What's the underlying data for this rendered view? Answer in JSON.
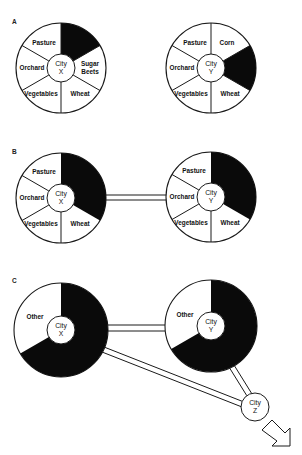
{
  "figure": {
    "panels": [
      {
        "id": "A",
        "label": "A",
        "cities": [
          {
            "name": "City X",
            "line1": "City",
            "line2": "X",
            "sectors": [
              {
                "label": "",
                "filled": true
              },
              {
                "label": "Sugar",
                "label2": "Beets",
                "filled": false
              },
              {
                "label": "Wheat",
                "filled": false
              },
              {
                "label": "Vegetables",
                "filled": false
              },
              {
                "label": "Orchard",
                "filled": false
              },
              {
                "label": "Pasture",
                "filled": false
              }
            ]
          },
          {
            "name": "City Y",
            "line1": "City",
            "line2": "Y",
            "sectors": [
              {
                "label": "Corn",
                "filled": false
              },
              {
                "label": "",
                "filled": true
              },
              {
                "label": "Wheat",
                "filled": false
              },
              {
                "label": "Vegetables",
                "filled": false
              },
              {
                "label": "Orchard",
                "filled": false
              },
              {
                "label": "Pasture",
                "filled": false
              }
            ]
          }
        ]
      },
      {
        "id": "B",
        "label": "B",
        "connection": "double road between City X and City Y",
        "cities": [
          {
            "name": "City X",
            "line1": "City",
            "line2": "X",
            "sectors": [
              {
                "label": "",
                "filled": true,
                "span": 2
              },
              {
                "label": "Wheat",
                "filled": false
              },
              {
                "label": "Vegetables",
                "filled": false
              },
              {
                "label": "Orchard",
                "filled": false
              },
              {
                "label": "Pasture",
                "filled": false
              }
            ]
          },
          {
            "name": "City Y",
            "line1": "City",
            "line2": "Y",
            "sectors": [
              {
                "label": "",
                "filled": true,
                "span": 2
              },
              {
                "label": "Wheat",
                "filled": false
              },
              {
                "label": "Vegetables",
                "filled": false
              },
              {
                "label": "Orchard",
                "filled": false
              },
              {
                "label": "Pasture",
                "filled": false
              }
            ]
          }
        ]
      },
      {
        "id": "C",
        "label": "C",
        "connection": "double roads X–Y, X–Z, Y–Z; arrow leaving City Z",
        "cities": [
          {
            "name": "City X",
            "line1": "City",
            "line2": "X",
            "sectors": [
              {
                "label": "",
                "filled": true,
                "span": 4
              },
              {
                "label": "Other",
                "filled": false,
                "span": 2
              }
            ]
          },
          {
            "name": "City Y",
            "line1": "City",
            "line2": "Y",
            "sectors": [
              {
                "label": "",
                "filled": true,
                "span": 4
              },
              {
                "label": "Other",
                "filled": false,
                "span": 2
              }
            ]
          },
          {
            "name": "City Z",
            "line1": "City",
            "line2": "Z"
          }
        ],
        "arrow": "outbound-arrow"
      }
    ]
  },
  "colors": {
    "fill": "#0a0a0a",
    "stroke": "#1a1a1a",
    "background": "#ffffff"
  }
}
